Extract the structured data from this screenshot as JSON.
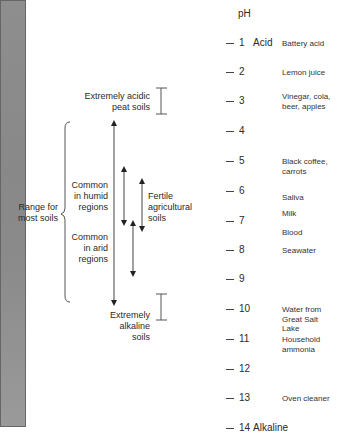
{
  "scale": {
    "title": "pH",
    "acid_label": "Acid",
    "alkaline_label": "Alkaline",
    "ticks": [
      {
        "value": "1",
        "y": 43
      },
      {
        "value": "2",
        "y": 72
      },
      {
        "value": "3",
        "y": 101
      },
      {
        "value": "4",
        "y": 131
      },
      {
        "value": "5",
        "y": 161
      },
      {
        "value": "6",
        "y": 191
      },
      {
        "value": "7",
        "y": 221
      },
      {
        "value": "8",
        "y": 250
      },
      {
        "value": "9",
        "y": 279
      },
      {
        "value": "10",
        "y": 309
      },
      {
        "value": "11",
        "y": 339
      },
      {
        "value": "12",
        "y": 369
      },
      {
        "value": "13",
        "y": 398
      },
      {
        "value": "14",
        "y": 428
      }
    ]
  },
  "examples": [
    {
      "text": "Battery acid",
      "ph": "1"
    },
    {
      "text": "Lemon juice",
      "ph": "2"
    },
    {
      "text": "Vinegar, cola, beer, apples",
      "line1": "Vinegar, cola,",
      "line2": "beer, apples",
      "ph": "3"
    },
    {
      "text": "Black coffee, carrots",
      "line1": "Black coffee,",
      "line2": "carrots",
      "ph": "5"
    },
    {
      "text": "Saliva",
      "ph": "6"
    },
    {
      "text": "Milk",
      "ph": "6.5"
    },
    {
      "text": "Blood",
      "ph": "7.4"
    },
    {
      "text": "Seawater",
      "ph": "8"
    },
    {
      "text": "Water from Great Salt Lake",
      "line1": "Water from",
      "line2": "Great Salt",
      "line3": "Lake",
      "ph": "10"
    },
    {
      "text": "Household ammonia",
      "line1": "Household",
      "line2": "ammonia",
      "ph": "11"
    },
    {
      "text": "Oven cleaner",
      "ph": "13"
    }
  ],
  "soil_ranges": {
    "acidic_peat": {
      "line1": "Extremely acidic",
      "line2": "peat soils",
      "range": "~2.5-3.5"
    },
    "most_soils": {
      "line1": "Range for",
      "line2": "most soils",
      "range": "~3.7-9.9"
    },
    "humid": {
      "line1": "Common",
      "line2": "in humid",
      "line3": "regions",
      "range": "~5-7"
    },
    "fertile": {
      "line1": "Fertile",
      "line2": "agricultural",
      "line3": "soils",
      "range": "~5.5-7.3"
    },
    "arid": {
      "line1": "Common",
      "line2": "in arid",
      "line3": "regions",
      "range": "~7-8.8"
    },
    "alkaline": {
      "line1": "Extremely",
      "line2": "alkaline",
      "line3": "soils",
      "range": "~9.5-10.4"
    }
  }
}
